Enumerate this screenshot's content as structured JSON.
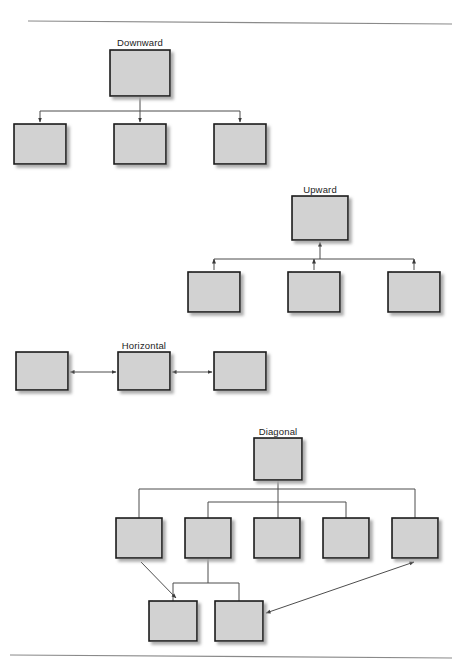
{
  "figure": {
    "background_color": "#ffffff",
    "box_fill": "#d2d2d2",
    "box_border": "#1a1a1a",
    "connector_color": "#4d4d4d",
    "rule_color": "#8a8a8a",
    "label_color": "#1c1c1c",
    "shadow_color": "#b4b4b4"
  },
  "page_rules": [
    {
      "name": "top-rule",
      "x1": 28,
      "y1": 21,
      "x2": 452,
      "y2": 24
    },
    {
      "name": "bottom-rule",
      "x1": 10,
      "y1": 655,
      "x2": 452,
      "y2": 658
    }
  ],
  "sections": [
    {
      "id": "downward",
      "label": "Downward",
      "label_x": 140,
      "label_y": 37,
      "arrow_direction": "down",
      "description": "Parent at top with arrows pointing down into three children",
      "parent": {
        "x": 110,
        "y": 50,
        "w": 60,
        "h": 46
      },
      "children": [
        {
          "x": 14,
          "y": 124,
          "w": 52,
          "h": 40
        },
        {
          "x": 114,
          "y": 124,
          "w": 52,
          "h": 40
        },
        {
          "x": 214,
          "y": 124,
          "w": 52,
          "h": 40
        }
      ],
      "bus_y": 111
    },
    {
      "id": "upward",
      "label": "Upward",
      "label_x": 320,
      "label_y": 184,
      "arrow_direction": "up",
      "description": "Three children at bottom with arrows pointing up toward the parent",
      "parent": {
        "x": 292,
        "y": 196,
        "w": 56,
        "h": 44
      },
      "children": [
        {
          "x": 188,
          "y": 272,
          "w": 52,
          "h": 40
        },
        {
          "x": 288,
          "y": 272,
          "w": 52,
          "h": 40
        },
        {
          "x": 388,
          "y": 272,
          "w": 52,
          "h": 40
        }
      ],
      "bus_y": 259
    },
    {
      "id": "horizontal",
      "label": "Horizontal",
      "label_x": 144,
      "label_y": 340,
      "arrow_direction": "both-horizontal",
      "description": "Three boxes in a row joined by double-headed horizontal arrows",
      "boxes": [
        {
          "x": 16,
          "y": 352,
          "w": 52,
          "h": 38
        },
        {
          "x": 118,
          "y": 352,
          "w": 52,
          "h": 38
        },
        {
          "x": 214,
          "y": 352,
          "w": 52,
          "h": 38
        }
      ],
      "arrow_y": 372
    },
    {
      "id": "diagonal",
      "label": "Diagonal",
      "label_x": 278,
      "label_y": 426,
      "arrow_direction": "diagonal",
      "description": "Parent over five children with two diagonal arrows to a lower pair of boxes",
      "parent": {
        "x": 254,
        "y": 438,
        "w": 48,
        "h": 42
      },
      "children": [
        {
          "x": 116,
          "y": 518,
          "w": 46,
          "h": 40
        },
        {
          "x": 185,
          "y": 518,
          "w": 46,
          "h": 40
        },
        {
          "x": 254,
          "y": 518,
          "w": 46,
          "h": 40
        },
        {
          "x": 323,
          "y": 518,
          "w": 46,
          "h": 40
        },
        {
          "x": 392,
          "y": 518,
          "w": 46,
          "h": 40
        }
      ],
      "grandchildren": [
        {
          "x": 149,
          "y": 601,
          "w": 48,
          "h": 40
        },
        {
          "x": 215,
          "y": 601,
          "w": 48,
          "h": 40
        }
      ],
      "outer_bus_y": 489,
      "inner_bus_y": 502,
      "lower_bus_y": 583,
      "diagonal_arrows": [
        {
          "name": "child1-to-grandchild1",
          "x1": 141,
          "y1": 562,
          "x2": 176,
          "y2": 598,
          "heads": "end"
        },
        {
          "name": "grandchild2-to-child5",
          "x1": 266,
          "y1": 613,
          "x2": 414,
          "y2": 562,
          "heads": "both"
        }
      ]
    }
  ]
}
